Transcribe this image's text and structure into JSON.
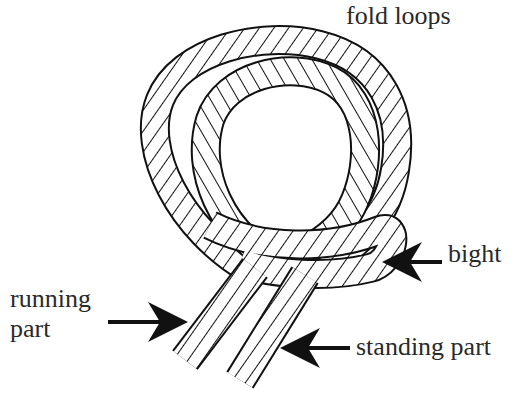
{
  "diagram": {
    "labels": {
      "fold_loops": "fold loops",
      "bight": "bight",
      "running_part_line1": "running",
      "running_part_line2": "part",
      "standing_part": "standing part"
    },
    "arrows": [
      {
        "name": "bight-arrow",
        "direction": "left",
        "points_to": "bight"
      },
      {
        "name": "running-part-arrow",
        "direction": "right",
        "points_to": "running part"
      },
      {
        "name": "standing-part-arrow",
        "direction": "left",
        "points_to": "standing part"
      }
    ],
    "colors": {
      "ink": "#111111",
      "text": "#2a2a2a",
      "background": "#ffffff"
    }
  }
}
